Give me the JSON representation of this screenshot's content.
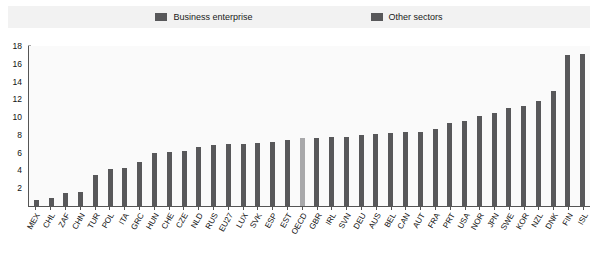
{
  "legend": {
    "entries": [
      {
        "label": "Business enterprise",
        "color": "#58585a",
        "icon": "legend-swatch-icon"
      },
      {
        "label": "Other sectors",
        "color": "#58585a",
        "icon": "legend-swatch-icon"
      }
    ]
  },
  "axis": {
    "y_ticks": [
      "0",
      "2",
      "4",
      "6",
      "8",
      "10",
      "12",
      "14",
      "16",
      "18"
    ]
  },
  "colors": {
    "bar": "#58585a",
    "bar_highlight": "#a8a8aa",
    "plot_background": "#fafafa",
    "legend_background": "#f2f2f2",
    "axis": "#555555",
    "text": "#111111"
  },
  "chart_data": {
    "type": "bar",
    "title": "",
    "subtitle": "",
    "xlabel": "",
    "ylabel": "",
    "ylim": [
      0,
      18
    ],
    "ytick_step": 2,
    "grid": false,
    "legend_position": "top",
    "highlight_category": "OECD",
    "categories": [
      "MEX",
      "CHL",
      "ZAF",
      "CHN",
      "TUR",
      "POL",
      "ITA",
      "GRC",
      "HUN",
      "CHE",
      "CZE",
      "NLD",
      "RUS",
      "EU27",
      "LUX",
      "SVK",
      "ESP",
      "EST",
      "OECD",
      "GBR",
      "IRL",
      "SVN",
      "DEU",
      "AUS",
      "BEL",
      "CAN",
      "AUT",
      "FRA",
      "PRT",
      "USA",
      "NOR",
      "JPN",
      "SWE",
      "KOR",
      "NZL",
      "DNK",
      "FIN",
      "ISL"
    ],
    "series": [
      {
        "name": "Business enterprise",
        "values": [
          0.7,
          0.9,
          1.5,
          1.6,
          3.5,
          4.2,
          4.3,
          5.0,
          6.0,
          6.1,
          6.2,
          6.6,
          6.9,
          7.0,
          7.0,
          7.1,
          7.2,
          7.4,
          7.7,
          7.7,
          7.8,
          7.8,
          8.0,
          8.1,
          8.2,
          8.3,
          8.3,
          8.7,
          9.3,
          9.6,
          10.1,
          10.5,
          11.0,
          11.3,
          11.8,
          12.9,
          17.0,
          17.1
        ]
      }
    ]
  }
}
